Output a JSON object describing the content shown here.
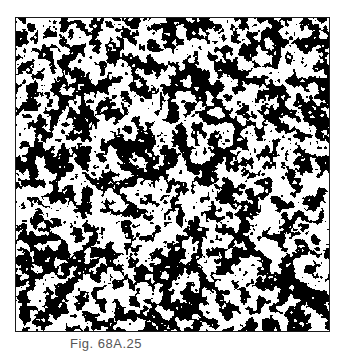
{
  "figure": {
    "caption": "Fig. 68A.25",
    "texture": {
      "foreground": "#000000",
      "background": "#ffffff",
      "frame_color": "#1a1a1a",
      "density": 0.5
    }
  }
}
